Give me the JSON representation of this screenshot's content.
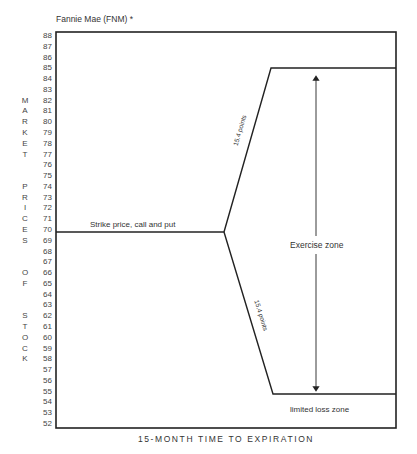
{
  "title": "Fannie Mae (FNM) *",
  "y_axis": {
    "vertical_label_letters": [
      {
        "char": "M",
        "at": 82
      },
      {
        "char": "A",
        "at": 81
      },
      {
        "char": "R",
        "at": 80
      },
      {
        "char": "K",
        "at": 79
      },
      {
        "char": "E",
        "at": 78
      },
      {
        "char": "T",
        "at": 77
      },
      {
        "char": "P",
        "at": 74
      },
      {
        "char": "R",
        "at": 73
      },
      {
        "char": "I",
        "at": 72
      },
      {
        "char": "C",
        "at": 71
      },
      {
        "char": "E",
        "at": 70
      },
      {
        "char": "S",
        "at": 69
      },
      {
        "char": "O",
        "at": 66
      },
      {
        "char": "F",
        "at": 65
      },
      {
        "char": "S",
        "at": 62
      },
      {
        "char": "T",
        "at": 61
      },
      {
        "char": "O",
        "at": 60
      },
      {
        "char": "C",
        "at": 59
      },
      {
        "char": "K",
        "at": 58
      }
    ],
    "vertical_label": "MARKET PRICES OF STOCK",
    "ticks": [
      88,
      87,
      86,
      85,
      84,
      83,
      82,
      81,
      80,
      79,
      78,
      77,
      76,
      75,
      74,
      73,
      72,
      71,
      70,
      69,
      68,
      67,
      66,
      65,
      64,
      63,
      62,
      61,
      60,
      59,
      58,
      57,
      56,
      55,
      54,
      53,
      52
    ]
  },
  "x_axis": {
    "label": "15-MONTH TIME TO EXPIRATION"
  },
  "labels": {
    "strike": "Strike price, call and put",
    "upper_diag": "15.4 points",
    "lower_diag": "15.4 points",
    "exercise_zone": "Exercise zone",
    "limited_loss_zone": "limited loss zone"
  },
  "chart_data": {
    "type": "line",
    "title": "Fannie Mae (FNM) *",
    "xlabel": "15-MONTH TIME TO EXPIRATION",
    "ylabel": "MARKET PRICES OF STOCK",
    "ylim": [
      52,
      88
    ],
    "grid": false,
    "series": [
      {
        "name": "Strike price, call and put",
        "points": [
          [
            0,
            70
          ],
          [
            0.5,
            70
          ]
        ]
      },
      {
        "name": "Upper breakeven (call)",
        "points": [
          [
            0.5,
            70
          ],
          [
            0.64,
            85.4
          ],
          [
            1.0,
            85.4
          ]
        ]
      },
      {
        "name": "Lower breakeven (put)",
        "points": [
          [
            0.5,
            70
          ],
          [
            0.64,
            54.6
          ],
          [
            1.0,
            54.6
          ]
        ]
      }
    ],
    "annotations": [
      {
        "text": "15.4 points",
        "on": "upper diagonal"
      },
      {
        "text": "15.4 points",
        "on": "lower diagonal"
      },
      {
        "text": "Exercise zone",
        "range": [
          54.6,
          85.4
        ],
        "arrow": "double"
      },
      {
        "text": "limited loss zone",
        "below": 54.6
      }
    ],
    "strike": 70,
    "upper_breakeven": 85.4,
    "lower_breakeven": 54.6
  }
}
